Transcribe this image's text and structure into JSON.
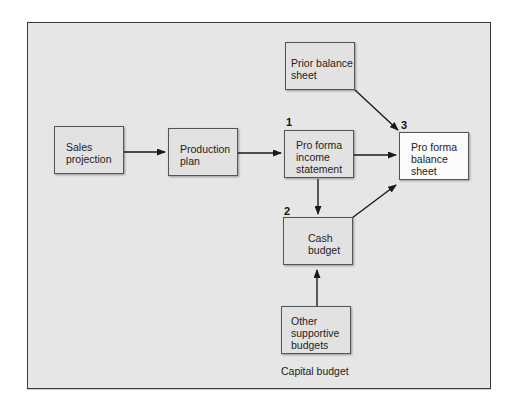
{
  "diagram": {
    "title": "",
    "nodes": [
      {
        "id": "sales_projection",
        "lines": [
          "Sales",
          "projection"
        ],
        "number": ""
      },
      {
        "id": "production_plan",
        "lines": [
          "Production",
          "plan"
        ],
        "number": ""
      },
      {
        "id": "pro_forma_income_statement",
        "lines": [
          "Pro forma",
          "income",
          "statement"
        ],
        "number": "1"
      },
      {
        "id": "prior_balance_sheet",
        "lines": [
          "Prior balance",
          "sheet"
        ],
        "number": ""
      },
      {
        "id": "pro_forma_balance_sheet",
        "lines": [
          "Pro forma",
          "balance",
          "sheet"
        ],
        "number": "3"
      },
      {
        "id": "cash_budget",
        "lines": [
          "Cash",
          "budget"
        ],
        "number": "2"
      },
      {
        "id": "other_supportive_budgets",
        "lines": [
          "Other",
          "supportive",
          "budgets"
        ],
        "number": ""
      }
    ],
    "caption": "Capital budget",
    "edges": [
      {
        "from": "sales_projection",
        "to": "production_plan"
      },
      {
        "from": "production_plan",
        "to": "pro_forma_income_statement"
      },
      {
        "from": "pro_forma_income_statement",
        "to": "pro_forma_balance_sheet"
      },
      {
        "from": "prior_balance_sheet",
        "to": "pro_forma_balance_sheet"
      },
      {
        "from": "pro_forma_income_statement",
        "to": "cash_budget"
      },
      {
        "from": "cash_budget",
        "to": "pro_forma_balance_sheet"
      },
      {
        "from": "other_supportive_budgets",
        "to": "cash_budget"
      }
    ],
    "colors": {
      "panel": "#e6e6e6",
      "box": "#e2e2e2",
      "highlight_box": "#fbfbfb",
      "line": "#222222"
    }
  }
}
